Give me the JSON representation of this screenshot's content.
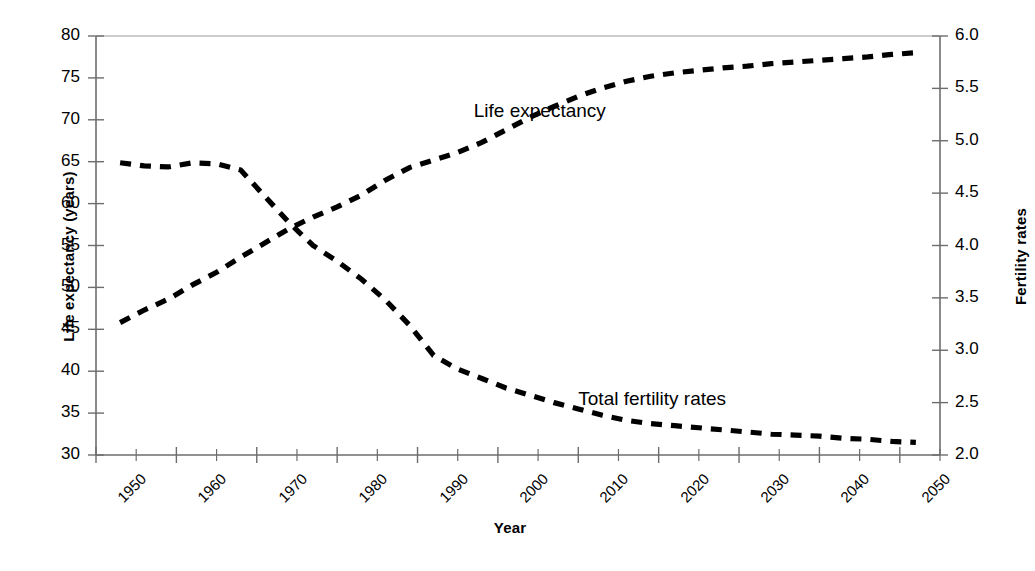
{
  "chart_data": {
    "type": "line",
    "title": "",
    "xlabel": "Year",
    "ylabel": "Life expectancy (years)",
    "y2label": "Fertility rates",
    "grid": false,
    "legend_position": "inline-annotation",
    "xlim": [
      1950,
      2055
    ],
    "ylim": [
      30,
      80
    ],
    "y2lim": [
      2.0,
      6.0
    ],
    "xticks": [
      "1950",
      "1960",
      "1970",
      "1980",
      "1990",
      "2000",
      "2010",
      "2020",
      "2030",
      "2040",
      "2050"
    ],
    "yticks": [
      "30",
      "35",
      "40",
      "45",
      "50",
      "55",
      "60",
      "65",
      "70",
      "75",
      "80"
    ],
    "y2ticks": [
      "2.0",
      "2.5",
      "3.0",
      "3.5",
      "4.0",
      "4.5",
      "5.0",
      "5.5",
      "6.0"
    ],
    "series": [
      {
        "name": "Life expectancy",
        "axis": "left",
        "style": "dashed",
        "color": "#000000",
        "x": [
          1953,
          1956,
          1959,
          1962,
          1965,
          1968,
          1971,
          1974,
          1977,
          1980,
          1983,
          1986,
          1989,
          1992,
          1995,
          1998,
          2001,
          2004,
          2007,
          2010,
          2013,
          2016,
          2019,
          2022,
          2025,
          2028,
          2031,
          2034,
          2037,
          2040,
          2043,
          2046,
          2049,
          2052
        ],
        "values": [
          45.8,
          47.3,
          48.6,
          50.3,
          51.8,
          53.6,
          55.3,
          57.0,
          58.4,
          59.6,
          61.0,
          62.8,
          64.3,
          65.2,
          66.1,
          67.3,
          68.8,
          70.3,
          71.6,
          72.8,
          73.8,
          74.6,
          75.2,
          75.6,
          75.9,
          76.2,
          76.4,
          76.7,
          76.9,
          77.1,
          77.3,
          77.5,
          77.8,
          78.0
        ]
      },
      {
        "name": "Total fertility rates",
        "axis": "right",
        "style": "dashed",
        "color": "#000000",
        "x": [
          1953,
          1956,
          1959,
          1962,
          1965,
          1968,
          1971,
          1974,
          1977,
          1980,
          1983,
          1986,
          1989,
          1992,
          1995,
          1998,
          2001,
          2004,
          2007,
          2010,
          2013,
          2016,
          2019,
          2022,
          2025,
          2028,
          2031,
          2034,
          2037,
          2040,
          2043,
          2046,
          2049,
          2052
        ],
        "values": [
          4.79,
          4.76,
          4.75,
          4.79,
          4.78,
          4.72,
          4.47,
          4.22,
          4.0,
          3.85,
          3.68,
          3.48,
          3.24,
          2.95,
          2.82,
          2.73,
          2.64,
          2.57,
          2.5,
          2.44,
          2.38,
          2.33,
          2.3,
          2.28,
          2.26,
          2.24,
          2.22,
          2.2,
          2.19,
          2.18,
          2.16,
          2.15,
          2.13,
          2.12
        ]
      }
    ],
    "annotations": [
      {
        "text": "Life expectancy",
        "x": 1997,
        "y": 70.8
      },
      {
        "text": "Total fertility rates",
        "x": 2010,
        "y": 36.5
      }
    ]
  }
}
